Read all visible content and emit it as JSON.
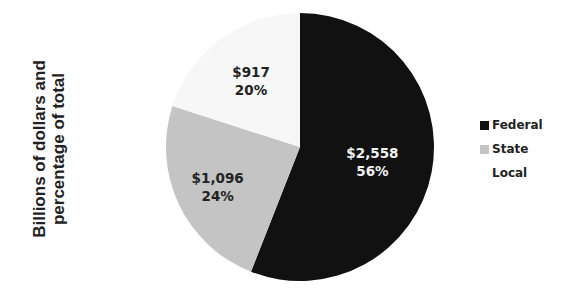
{
  "chart_data": {
    "type": "pie",
    "title": "",
    "ylabel": "Billions of dollars and percentage of total",
    "ylabel_lines": [
      "Billions of dollars and",
      "percentage of total"
    ],
    "categories": [
      "Federal",
      "State",
      "Local"
    ],
    "values": [
      2558,
      1096,
      917
    ],
    "percentages": [
      56,
      24,
      20
    ],
    "value_labels": [
      "$2,558",
      "$1,096",
      "$917"
    ],
    "percent_labels": [
      "56%",
      "24%",
      "20%"
    ],
    "colors": [
      "#111111",
      "#c4c4c4",
      "#f7f7f7"
    ],
    "label_colors": [
      "#f2f2f2",
      "#222222",
      "#222222"
    ],
    "start_angle": "12 o'clock",
    "direction": "clockwise",
    "legend_position": "right"
  },
  "legend": {
    "items": [
      {
        "label": "Federal",
        "color": "#111111"
      },
      {
        "label": "State",
        "color": "#c4c4c4"
      },
      {
        "label": "Local",
        "color": "#ffffff"
      }
    ]
  }
}
